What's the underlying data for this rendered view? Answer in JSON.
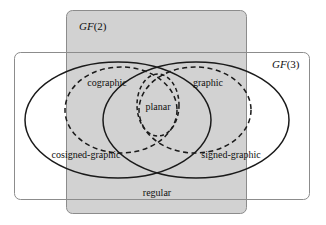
{
  "diagram": {
    "background_color": "#ffffff",
    "shaded_fill": "#d2d2d2",
    "line_color": "#1a1a1a",
    "rect_stroke_color": "#8c8c8c",
    "regions": {
      "gf2": {
        "label_prefix": "GF",
        "label_arg": "(2)",
        "label_full": "GF(2)",
        "style": "shaded rounded rectangle",
        "fill": "#d2d2d2"
      },
      "gf3": {
        "label_prefix": "GF",
        "label_arg": "(3)",
        "label_full": "GF(3)",
        "style": "unshaded rounded rectangle",
        "fill": "none"
      }
    },
    "sets": [
      {
        "id": "cosigned-graphic",
        "label": "cosigned-graphic",
        "shape": "ellipse",
        "stroke": "solid"
      },
      {
        "id": "signed-graphic",
        "label": "signed-graphic",
        "shape": "ellipse",
        "stroke": "solid"
      },
      {
        "id": "cographic",
        "label": "cographic",
        "shape": "ellipse",
        "stroke": "dashed"
      },
      {
        "id": "graphic",
        "label": "graphic",
        "shape": "ellipse",
        "stroke": "dashed"
      },
      {
        "id": "planar",
        "label": "planar",
        "shape": "ellipse",
        "stroke": "dashed"
      },
      {
        "id": "regular",
        "label": "regular",
        "shape": "intersection-region",
        "stroke": "none"
      }
    ],
    "labels": {
      "gf2": "GF(2)",
      "gf3": "GF(3)",
      "cographic": "cographic",
      "graphic": "graphic",
      "planar": "planar",
      "cosigned_graphic": "cosigned-graphic",
      "signed_graphic": "signed-graphic",
      "regular": "regular"
    }
  }
}
